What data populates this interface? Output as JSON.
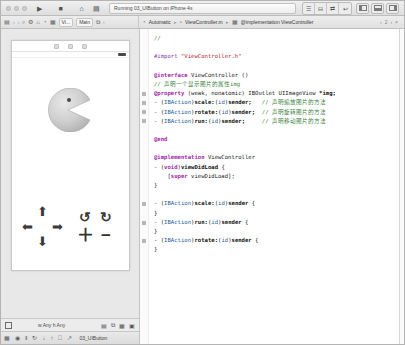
{
  "window": {
    "title": "Running 03_UIButton on iPhone 4s"
  },
  "toolbar": {
    "run_label": "▶",
    "stop_label": "■",
    "scheme_home_label": "⌂",
    "scheme_device_label": "▤",
    "status_text": "Running 03_UIButton on iPhone 4s",
    "editor_segments": [
      "☰",
      "⊟",
      "⇄",
      "↩"
    ],
    "pane_buttons": [
      "left-pane",
      "bottom-pane",
      "right-pane"
    ]
  },
  "jumpbar": {
    "folder_icon": "▤",
    "back_label": "‹",
    "forward_label": "›",
    "left_crumbs": [
      "▤",
      "⌕",
      "⚙",
      "⌂",
      "◔",
      "▦",
      "⧉"
    ],
    "view_chip_label": "Vi...",
    "main_chip_label": "Main",
    "scheme_label": "Automatic",
    "file_label": "ViewController.m",
    "symbol_label": "@implementation ViewController",
    "nav_prev": "‹",
    "nav_count": "2",
    "nav_next": "›",
    "nav_close": "×"
  },
  "interface_builder": {
    "device_controls": [
      "◎",
      "◔",
      "▣"
    ],
    "image_name": "pacman-image",
    "buttons": {
      "up": "⬆",
      "down": "⬇",
      "left": "⬅",
      "right": "➡",
      "rotate_ccw": "↺",
      "rotate_cw": "↻",
      "zoom_in": "＋",
      "zoom_out": "−"
    },
    "size_class_label": "w Any  h Any",
    "size_right_icons": [
      "▤",
      "⧉",
      "▦",
      "▣"
    ],
    "debug_icons": [
      "▦",
      "◉",
      "‖",
      "↻",
      "↓",
      "↑",
      "⎕",
      "↗"
    ],
    "debug_label": "03_UIButton"
  },
  "editor": {
    "lines": [
      [
        {
          "t": "//",
          "c": "cmt"
        }
      ],
      [],
      [
        {
          "t": "#import ",
          "c": "pre"
        },
        {
          "t": "\"ViewController.h\"",
          "c": "str"
        }
      ],
      [],
      [
        {
          "t": "@interface",
          "c": "kw"
        },
        {
          "t": " ViewController ()",
          "c": "plain"
        }
      ],
      [
        {
          "t": "// 声明一个显示图片的属性img",
          "c": "cmt"
        }
      ],
      [
        {
          "t": "@property",
          "c": "kw"
        },
        {
          "t": " (weak, nonatomic) IBOutlet UIImageView ",
          "c": "plain"
        },
        {
          "t": "*img;",
          "c": "meth"
        }
      ],
      [
        {
          "t": "- (",
          "c": "plain"
        },
        {
          "t": "IBAction",
          "c": "type"
        },
        {
          "t": ")",
          "c": "plain"
        },
        {
          "t": "scale:",
          "c": "meth"
        },
        {
          "t": "(",
          "c": "plain"
        },
        {
          "t": "id",
          "c": "type"
        },
        {
          "t": ")",
          "c": "plain"
        },
        {
          "t": "sender;",
          "c": "meth"
        },
        {
          "t": "   // 声明缩放图片的方法",
          "c": "cmt"
        }
      ],
      [
        {
          "t": "- (",
          "c": "plain"
        },
        {
          "t": "IBAction",
          "c": "type"
        },
        {
          "t": ")",
          "c": "plain"
        },
        {
          "t": "rotate:",
          "c": "meth"
        },
        {
          "t": "(",
          "c": "plain"
        },
        {
          "t": "id",
          "c": "type"
        },
        {
          "t": ")",
          "c": "plain"
        },
        {
          "t": "sender;",
          "c": "meth"
        },
        {
          "t": "  // 声明旋转图片的方法",
          "c": "cmt"
        }
      ],
      [
        {
          "t": "- (",
          "c": "plain"
        },
        {
          "t": "IBAction",
          "c": "type"
        },
        {
          "t": ")",
          "c": "plain"
        },
        {
          "t": "run:",
          "c": "meth"
        },
        {
          "t": "(",
          "c": "plain"
        },
        {
          "t": "id",
          "c": "type"
        },
        {
          "t": ")",
          "c": "plain"
        },
        {
          "t": "sender;",
          "c": "meth"
        },
        {
          "t": "     // 声明移动图片的方法",
          "c": "cmt"
        }
      ],
      [],
      [
        {
          "t": "@end",
          "c": "kw"
        }
      ],
      [],
      [
        {
          "t": "@implementation",
          "c": "kw"
        },
        {
          "t": " ViewController",
          "c": "plain"
        }
      ],
      [
        {
          "t": "- (",
          "c": "plain"
        },
        {
          "t": "void",
          "c": "kw"
        },
        {
          "t": ")",
          "c": "plain"
        },
        {
          "t": "viewDidLoad",
          "c": "meth"
        },
        {
          "t": " {",
          "c": "plain"
        }
      ],
      [
        {
          "t": "    [",
          "c": "plain"
        },
        {
          "t": "super",
          "c": "kw"
        },
        {
          "t": " viewDidLoad];",
          "c": "plain"
        }
      ],
      [
        {
          "t": "}",
          "c": "plain"
        }
      ],
      [],
      [
        {
          "t": "- (",
          "c": "plain"
        },
        {
          "t": "IBAction",
          "c": "type"
        },
        {
          "t": ")",
          "c": "plain"
        },
        {
          "t": "scale:",
          "c": "meth"
        },
        {
          "t": "(",
          "c": "plain"
        },
        {
          "t": "id",
          "c": "type"
        },
        {
          "t": ")",
          "c": "plain"
        },
        {
          "t": "sender",
          "c": "meth"
        },
        {
          "t": " {",
          "c": "plain"
        }
      ],
      [
        {
          "t": "}",
          "c": "plain"
        }
      ],
      [
        {
          "t": "- (",
          "c": "plain"
        },
        {
          "t": "IBAction",
          "c": "type"
        },
        {
          "t": ")",
          "c": "plain"
        },
        {
          "t": "run:",
          "c": "meth"
        },
        {
          "t": "(",
          "c": "plain"
        },
        {
          "t": "id",
          "c": "type"
        },
        {
          "t": ")",
          "c": "plain"
        },
        {
          "t": "sender",
          "c": "meth"
        },
        {
          "t": " {",
          "c": "plain"
        }
      ],
      [
        {
          "t": "}",
          "c": "plain"
        }
      ],
      [
        {
          "t": "- (",
          "c": "plain"
        },
        {
          "t": "IBAction",
          "c": "type"
        },
        {
          "t": ")",
          "c": "plain"
        },
        {
          "t": "rotate:",
          "c": "meth"
        },
        {
          "t": "(",
          "c": "plain"
        },
        {
          "t": "id",
          "c": "type"
        },
        {
          "t": ")",
          "c": "plain"
        },
        {
          "t": "sender",
          "c": "meth"
        },
        {
          "t": " {",
          "c": "plain"
        }
      ],
      [
        {
          "t": "}",
          "c": "plain"
        }
      ]
    ],
    "gutter_marks": [
      6,
      7,
      8,
      9,
      18,
      20,
      22
    ]
  },
  "colors": {
    "keyword": "#a223a8",
    "string": "#b02a2a",
    "comment": "#3f7f3f",
    "type": "#1b5e9e",
    "chrome": "#e8e8e8"
  }
}
